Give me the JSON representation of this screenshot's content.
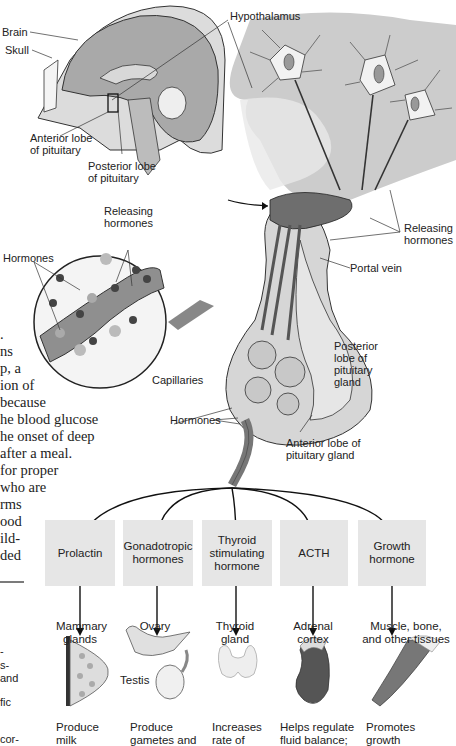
{
  "diagram": {
    "head_labels": {
      "brain": "Brain",
      "skull": "Skull",
      "hypothalamus": "Hypothalamus",
      "anterior_lobe": "Anterior lobe\nof pituitary",
      "posterior_lobe": "Posterior lobe\nof pituitary"
    },
    "detail_labels": {
      "releasing_hormones_top": "Releasing\nhormones",
      "hormones_inset": "Hormones",
      "releasing_hormones_right": "Releasing\nhormones",
      "portal_vein": "Portal vein",
      "posterior_lobe_gland": "Posterior\nlobe of\npituitary\ngland",
      "capillaries": "Capillaries",
      "hormones": "Hormones",
      "anterior_lobe_gland": "Anterior lobe of\npituitary gland"
    },
    "side_text_fragments": [
      ".",
      "ns",
      "p, a",
      "ion of",
      " because",
      "he blood glucose",
      "he onset of deep",
      "after a meal.",
      " for proper",
      "who are",
      "rms",
      "ood",
      "ild-",
      "ded"
    ],
    "side_text_bottom": [
      "-",
      "s-",
      "and",
      "fic",
      "cor-"
    ],
    "hormones": [
      {
        "name": "Prolactin",
        "target": "Mammary\nglands",
        "effect": "Produce\nmilk"
      },
      {
        "name": "Gonadotropic\nhormones",
        "target": "Ovary",
        "target2": "Testis",
        "effect": "Produce\ngametes and"
      },
      {
        "name": "Thyroid\nstimulating\nhormone",
        "target": "Thyroid\ngland",
        "effect": "Increases\nrate of"
      },
      {
        "name": "ACTH",
        "target": "Adrenal\ncortex",
        "effect": "Helps regulate\nfluid balance;"
      },
      {
        "name": "Growth\nhormone",
        "target": "Muscle, bone,\nand other tissues",
        "effect": "Promotes\ngrowth"
      }
    ],
    "colors": {
      "box_fill": "#e6e6e6",
      "tissue_gray": "#cfcfcf",
      "dark_gray": "#8a8a8a",
      "vessel": "#6e6e6e"
    }
  }
}
